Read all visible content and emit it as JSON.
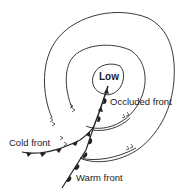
{
  "diagram": {
    "center_label": "Low",
    "labels": {
      "occluded": "Occluded front",
      "cold": "Cold front",
      "warm": "Warm front"
    },
    "colors": {
      "line": "#222222",
      "background": "#ffffff"
    },
    "elements": [
      {
        "type": "isobar",
        "name": "inner-isobar"
      },
      {
        "type": "isobar",
        "name": "middle-isobar"
      },
      {
        "type": "isobar",
        "name": "outer-isobar"
      },
      {
        "type": "front",
        "name": "occluded-front"
      },
      {
        "type": "front",
        "name": "cold-front"
      },
      {
        "type": "front",
        "name": "warm-front"
      }
    ]
  }
}
